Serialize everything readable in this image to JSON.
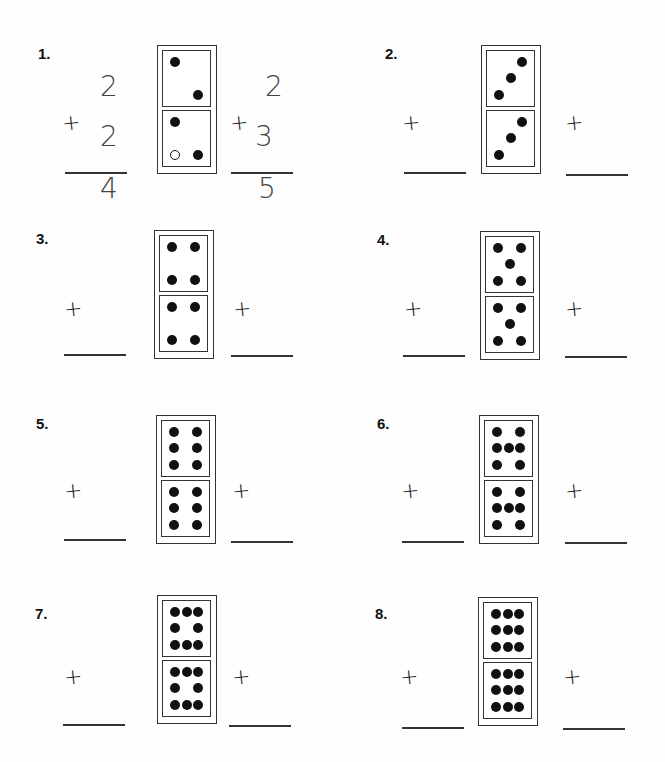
{
  "problems": [
    {
      "label": "1.",
      "top_pips": 2,
      "bottom_pips": 3,
      "example": {
        "left": {
          "a": "2",
          "b": "2",
          "sum": "4"
        },
        "right": {
          "a": "2",
          "b": "3",
          "sum": "5"
        }
      }
    },
    {
      "label": "2.",
      "top_pips": 3,
      "bottom_pips": 3
    },
    {
      "label": "3.",
      "top_pips": 4,
      "bottom_pips": 4
    },
    {
      "label": "4.",
      "top_pips": 5,
      "bottom_pips": 5
    },
    {
      "label": "5.",
      "top_pips": 6,
      "bottom_pips": 6
    },
    {
      "label": "6.",
      "top_pips": 7,
      "bottom_pips": 7
    },
    {
      "label": "7.",
      "top_pips": 8,
      "bottom_pips": 8
    },
    {
      "label": "8.",
      "top_pips": 9,
      "bottom_pips": 9
    }
  ],
  "symbols": {
    "plus": "+"
  }
}
